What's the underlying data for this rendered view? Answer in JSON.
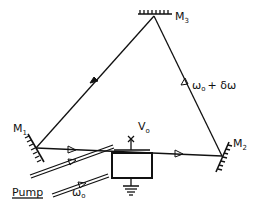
{
  "diagram": {
    "type": "ring laser cavity with electro-optic modulator",
    "mirrors": [
      {
        "id": "M1",
        "label": "M",
        "sub": "1"
      },
      {
        "id": "M2",
        "label": "M",
        "sub": "2"
      },
      {
        "id": "M3",
        "label": "M",
        "sub": "3"
      }
    ],
    "beam_label": "ω₀ + δω",
    "beam_label_main": "ω",
    "beam_label_sub": "o",
    "beam_label_rest": "+ δω",
    "pump_label": "Pump",
    "pump_freq_main": "ω",
    "pump_freq_sub": "o",
    "voltage_main": "V",
    "voltage_sub": "o",
    "line_color": "#111111",
    "background": "#ffffff"
  }
}
